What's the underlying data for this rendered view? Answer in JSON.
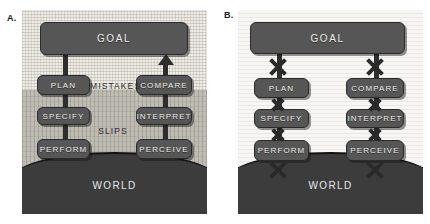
{
  "figure": {
    "panels": [
      {
        "id": "A",
        "label": "A.",
        "goal": "GOAL",
        "left_column": [
          "PLAN",
          "SPECIFY",
          "PERFORM"
        ],
        "right_column": [
          "COMPARE",
          "INTERPRET",
          "PERCEIVE"
        ],
        "regions": [
          "MISTAKES",
          "SLIPS"
        ],
        "world": "WORLD"
      },
      {
        "id": "B",
        "label": "B.",
        "goal": "GOAL",
        "left_column": [
          "PLAN",
          "SPECIFY",
          "PERFORM"
        ],
        "right_column": [
          "COMPARE",
          "INTERPRET",
          "PERCEIVE"
        ],
        "regions": [],
        "world": "WORLD"
      }
    ]
  },
  "colors": {
    "box_fill": "#565656",
    "box_text": "#f0efec",
    "world_fill": "#3c3c3c",
    "connector": "#2e2e2e",
    "mistakes_band": "#efece6",
    "slips_band": "#bfbcb4",
    "panel_b_background": "#f7f6f4"
  }
}
